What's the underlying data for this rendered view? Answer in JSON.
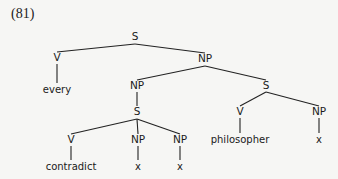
{
  "example_number": "(81)",
  "tree": {
    "nodes": [
      {
        "id": "s1",
        "label": "S",
        "x": 135,
        "y": 40
      },
      {
        "id": "v1",
        "label": "V",
        "x": 57,
        "y": 61
      },
      {
        "id": "every",
        "label": "every",
        "x": 57,
        "y": 93,
        "leaf": true
      },
      {
        "id": "np1",
        "label": "NP",
        "x": 205,
        "y": 62
      },
      {
        "id": "np2",
        "label": "NP",
        "x": 137,
        "y": 89
      },
      {
        "id": "s2",
        "label": "S",
        "x": 266,
        "y": 89
      },
      {
        "id": "s3",
        "label": "S",
        "x": 137,
        "y": 115
      },
      {
        "id": "v2",
        "label": "V",
        "x": 71,
        "y": 143
      },
      {
        "id": "np3",
        "label": "NP",
        "x": 138,
        "y": 143
      },
      {
        "id": "np4",
        "label": "NP",
        "x": 180,
        "y": 143
      },
      {
        "id": "contradict",
        "label": "contradict",
        "x": 71,
        "y": 170,
        "leaf": true
      },
      {
        "id": "x1",
        "label": "x",
        "x": 138,
        "y": 170,
        "leaf": true
      },
      {
        "id": "x2",
        "label": "x",
        "x": 180,
        "y": 170,
        "leaf": true
      },
      {
        "id": "v3",
        "label": "V",
        "x": 240,
        "y": 115
      },
      {
        "id": "np5",
        "label": "NP",
        "x": 319,
        "y": 115
      },
      {
        "id": "philosopher",
        "label": "philosopher",
        "x": 240,
        "y": 143,
        "leaf": true
      },
      {
        "id": "x3",
        "label": "x",
        "x": 319,
        "y": 143,
        "leaf": true
      }
    ]
  }
}
